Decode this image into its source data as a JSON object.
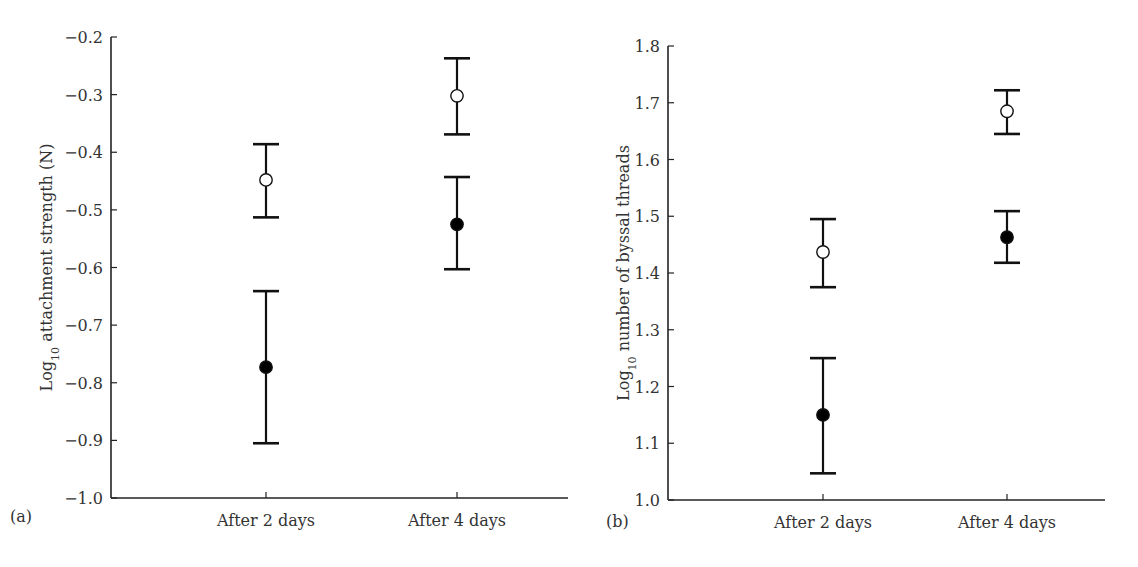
{
  "chart_data": [
    {
      "type": "scatter",
      "panel_label": "(a)",
      "title": "",
      "xlabel": "",
      "ylabel": "Log10 attachment strength (N)",
      "ylabel_parts": {
        "prefix": "Log",
        "subscript": "10",
        "suffix": " attachment strength (N)"
      },
      "categories": [
        "After 2 days",
        "After 4 days"
      ],
      "ylim": [
        -1.0,
        -0.2
      ],
      "yticks": [
        -1.0,
        -0.9,
        -0.8,
        -0.7,
        -0.6,
        -0.5,
        -0.4,
        -0.3,
        -0.2
      ],
      "ytick_labels": [
        "−1.0",
        "−0.9",
        "−0.8",
        "−0.7",
        "−0.6",
        "−0.5",
        "−0.4",
        "−0.3",
        "−0.2"
      ],
      "grid": false,
      "legend": null,
      "series": [
        {
          "name": "open circles",
          "marker": "open",
          "values": [
            -0.448,
            -0.302
          ],
          "upper": [
            -0.386,
            -0.237
          ],
          "lower": [
            -0.513,
            -0.369
          ]
        },
        {
          "name": "filled circles",
          "marker": "filled",
          "values": [
            -0.773,
            -0.525
          ],
          "upper": [
            -0.641,
            -0.443
          ],
          "lower": [
            -0.905,
            -0.603
          ]
        }
      ],
      "layout": {
        "x0": 111,
        "x1": 568,
        "ytop": 37,
        "ybot": 498,
        "cat_x": [
          266,
          457
        ],
        "ylabel_x": 46,
        "tag_x": 10,
        "tag_y": 522
      }
    },
    {
      "type": "scatter",
      "panel_label": "(b)",
      "title": "",
      "xlabel": "",
      "ylabel": "Log10 number of byssal threads",
      "ylabel_parts": {
        "prefix": "Log",
        "subscript": "10",
        "suffix": " number of byssal threads"
      },
      "categories": [
        "After 2 days",
        "After 4 days"
      ],
      "ylim": [
        1.0,
        1.8
      ],
      "yticks": [
        1.0,
        1.1,
        1.2,
        1.3,
        1.4,
        1.5,
        1.6,
        1.7,
        1.8
      ],
      "ytick_labels": [
        "1.0",
        "1.1",
        "1.2",
        "1.3",
        "1.4",
        "1.5",
        "1.6",
        "1.7",
        "1.8"
      ],
      "grid": false,
      "legend": null,
      "series": [
        {
          "name": "open circles",
          "marker": "open",
          "values": [
            1.437,
            1.685
          ],
          "upper": [
            1.495,
            1.722
          ],
          "lower": [
            1.375,
            1.645
          ]
        },
        {
          "name": "filled circles",
          "marker": "filled",
          "values": [
            1.15,
            1.463
          ],
          "upper": [
            1.25,
            1.509
          ],
          "lower": [
            1.047,
            1.418
          ]
        }
      ],
      "layout": {
        "x0": 668,
        "x1": 1105,
        "ytop": 46,
        "ybot": 500,
        "cat_x": [
          823,
          1007
        ],
        "ylabel_x": 623,
        "tag_x": 606,
        "tag_y": 527
      }
    }
  ]
}
